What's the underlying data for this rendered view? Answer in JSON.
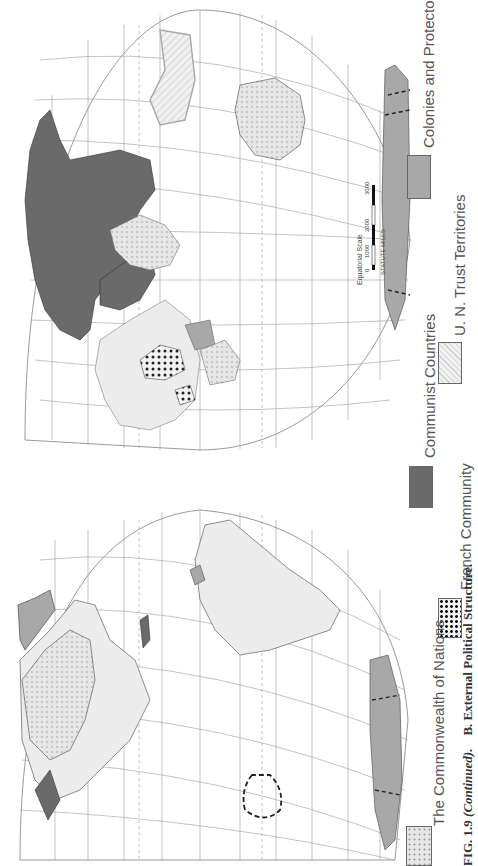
{
  "figure": {
    "caption_number": "FIG. 1.9",
    "caption_continued": "(Continued).",
    "caption_title": "B. External Political Structure.",
    "orientation": "rotated 90° counter-clockwise on page"
  },
  "legend": {
    "items": [
      {
        "label": "The Commonwealth of Nations",
        "pattern": "light-stipple",
        "color": "#e2e2e2"
      },
      {
        "label": "French Community",
        "pattern": "heavy-dots",
        "color": "#f0f0f0"
      },
      {
        "label": "Communist Countries",
        "pattern": "solid-dark",
        "color": "#6a6a6a"
      },
      {
        "label": "U. N. Trust Territories",
        "pattern": "hatched",
        "color": "#ececec"
      },
      {
        "label": "Colonies and Protectorates",
        "pattern": "solid-mid",
        "color": "#a8a8a8"
      }
    ]
  },
  "scale_bar": {
    "title": "Equatorial Scale",
    "units": "STATUTE MILES",
    "ticks": [
      "0",
      "1000",
      "2000",
      "3000"
    ]
  },
  "maps": {
    "western_hemisphere": {
      "latitude_labels": [
        "75",
        "60",
        "45",
        "30",
        "15",
        "0",
        "15",
        "30",
        "45",
        "60",
        "75"
      ],
      "longitude_labels": [
        "180",
        "165",
        "150",
        "135",
        "120",
        "105",
        "90",
        "75",
        "60",
        "45",
        "30"
      ],
      "polar_labels_north": [
        "90",
        "180",
        "150",
        "120",
        "90",
        "60",
        "30",
        "0",
        "30",
        "60",
        "90"
      ],
      "polar_labels_south": [
        "90",
        "180",
        "150",
        "120",
        "90",
        "60",
        "30",
        "0",
        "90"
      ]
    },
    "eastern_hemisphere": {
      "latitude_labels": [
        "75",
        "60",
        "45",
        "30",
        "15",
        "0",
        "15",
        "30",
        "45",
        "60",
        "75"
      ],
      "longitude_labels": [
        "0",
        "15",
        "30",
        "45",
        "60",
        "75",
        "90",
        "105",
        "120",
        "135",
        "150",
        "165",
        "180"
      ],
      "polar_labels_north": [
        "90",
        "60",
        "30",
        "0",
        "30",
        "60",
        "90",
        "120",
        "150",
        "180",
        "90"
      ],
      "polar_labels_south": [
        "90",
        "60",
        "30",
        "0",
        "30",
        "60",
        "90",
        "120",
        "150",
        "180",
        "90"
      ]
    }
  },
  "colors": {
    "background": "#ffffff",
    "graticule": "#9a9a9a",
    "land_neutral": "#ececec",
    "communist": "#6a6a6a",
    "colonies": "#a8a8a8",
    "commonwealth": "#e2e2e2",
    "text": "#444444"
  }
}
